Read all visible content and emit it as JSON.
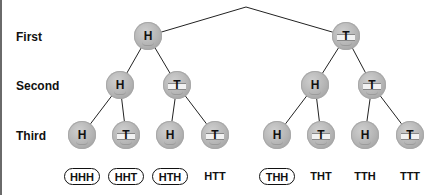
{
  "diagram": {
    "type": "probability-tree",
    "row_labels": [
      "First",
      "Second",
      "Third"
    ],
    "root": {
      "x": 246,
      "y": 7
    },
    "levels": [
      {
        "label": "First",
        "coins": [
          {
            "face": "H",
            "x": 148,
            "y": 36,
            "parent": "root"
          },
          {
            "face": "T",
            "x": 346,
            "y": 36,
            "parent": "root"
          }
        ]
      },
      {
        "label": "Second",
        "coins": [
          {
            "face": "H",
            "x": 120,
            "y": 85,
            "parent": 0
          },
          {
            "face": "T",
            "x": 177,
            "y": 85,
            "parent": 0
          },
          {
            "face": "H",
            "x": 315,
            "y": 85,
            "parent": 1
          },
          {
            "face": "T",
            "x": 372,
            "y": 85,
            "parent": 1
          }
        ]
      },
      {
        "label": "Third",
        "coins": [
          {
            "face": "H",
            "x": 82,
            "y": 135,
            "parent": 0
          },
          {
            "face": "T",
            "x": 126,
            "y": 135,
            "parent": 0
          },
          {
            "face": "H",
            "x": 170,
            "y": 135,
            "parent": 1
          },
          {
            "face": "T",
            "x": 215,
            "y": 135,
            "parent": 1
          },
          {
            "face": "H",
            "x": 277,
            "y": 135,
            "parent": 2
          },
          {
            "face": "T",
            "x": 321,
            "y": 135,
            "parent": 2
          },
          {
            "face": "H",
            "x": 365,
            "y": 135,
            "parent": 3
          },
          {
            "face": "T",
            "x": 410,
            "y": 135,
            "parent": 3
          }
        ]
      }
    ],
    "outcomes": [
      {
        "label": "HHH",
        "circled": true
      },
      {
        "label": "HHT",
        "circled": true
      },
      {
        "label": "HTH",
        "circled": true
      },
      {
        "label": "HTT",
        "circled": false
      },
      {
        "label": "THH",
        "circled": true
      },
      {
        "label": "THT",
        "circled": false
      },
      {
        "label": "TTH",
        "circled": false
      },
      {
        "label": "TTT",
        "circled": false
      }
    ],
    "colors": {
      "coin": "#b4b4b4",
      "line": "#222222",
      "text": "#111111",
      "border": "#6a6a6a"
    }
  }
}
